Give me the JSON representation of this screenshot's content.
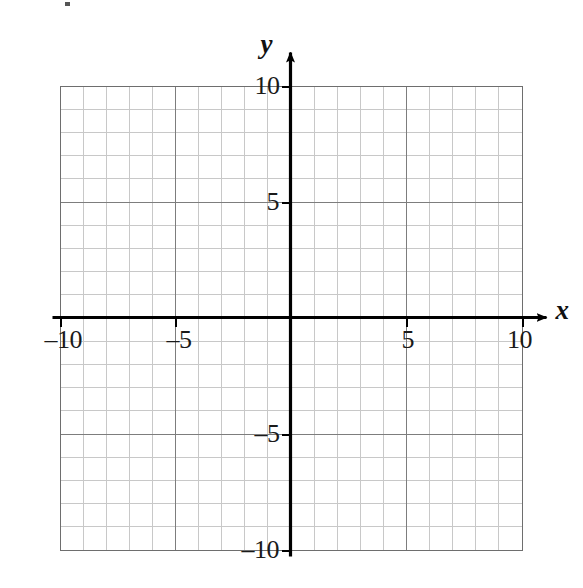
{
  "figure": {
    "kind": "cartesian-coordinate-grid",
    "background_color": "#ffffff",
    "axis_color": "#000000",
    "major_grid_color": "#7d7d7d",
    "minor_grid_color": "#c8c8c8",
    "border_color": "#6e6e6e",
    "label_color": "#1a1a1a"
  },
  "axes": {
    "x_name": "x",
    "y_name": "y",
    "x_arrow": "right-arrowhead",
    "y_arrow": "up-arrowhead"
  },
  "labels": {
    "x": [
      {
        "value": -10,
        "text": "–10"
      },
      {
        "value": -5,
        "text": "–5"
      },
      {
        "value": 5,
        "text": "5"
      },
      {
        "value": 10,
        "text": "10"
      }
    ],
    "y": [
      {
        "value": 10,
        "text": "10"
      },
      {
        "value": 5,
        "text": "5"
      },
      {
        "value": -5,
        "text": "–5"
      },
      {
        "value": -10,
        "text": "–10"
      }
    ]
  },
  "chart_data": {
    "type": "scatter",
    "title": "",
    "subtitle": "",
    "xlabel": "x",
    "ylabel": "y",
    "xlim": [
      -10,
      10
    ],
    "ylim": [
      -10,
      10
    ],
    "x_major_ticks": [
      -10,
      -5,
      5,
      10
    ],
    "y_major_ticks": [
      -10,
      -5,
      5,
      10
    ],
    "x_tick_labels": [
      "–10",
      "–5",
      "5",
      "10"
    ],
    "y_tick_labels": [
      "–10",
      "–5",
      "5",
      "10"
    ],
    "x_minor_step": 1,
    "y_minor_step": 1,
    "major_grid_step": 5,
    "grid": true,
    "legend": false,
    "legend_position": "none",
    "series": [],
    "annotations": []
  }
}
